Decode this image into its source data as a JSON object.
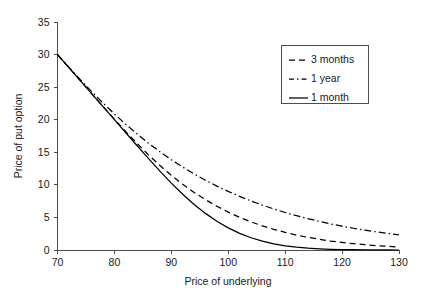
{
  "chart_data": {
    "type": "line",
    "title": "",
    "xlabel": "Price of underlying",
    "ylabel": "Price of put option",
    "xlim": [
      70,
      130
    ],
    "ylim": [
      0,
      35
    ],
    "xticks": [
      70,
      80,
      90,
      100,
      110,
      120,
      130
    ],
    "yticks": [
      0,
      5,
      10,
      15,
      20,
      25,
      30,
      35
    ],
    "grid": false,
    "legend_position": "top-right",
    "x": [
      70,
      72,
      74,
      76,
      78,
      80,
      82,
      84,
      86,
      88,
      90,
      92,
      94,
      96,
      98,
      100,
      102,
      104,
      106,
      108,
      110,
      112,
      114,
      116,
      118,
      120,
      122,
      124,
      126,
      128,
      130
    ],
    "series": [
      {
        "name": "3 months",
        "style": "dashed",
        "color": "#000000",
        "values": [
          30.0,
          28.0,
          26.0,
          24.0,
          22.02,
          20.07,
          18.17,
          16.34,
          14.6,
          12.97,
          11.47,
          10.09,
          8.84,
          7.72,
          6.72,
          5.82,
          5.02,
          4.32,
          3.71,
          3.17,
          2.7,
          2.29,
          1.94,
          1.64,
          1.38,
          1.16,
          0.97,
          0.81,
          0.67,
          0.56,
          0.46
        ]
      },
      {
        "name": "1 year",
        "style": "dash-dot",
        "color": "#000000",
        "values": [
          30.0,
          28.06,
          26.16,
          24.32,
          22.56,
          20.88,
          19.29,
          17.79,
          16.39,
          15.08,
          13.86,
          12.73,
          11.68,
          10.71,
          9.81,
          8.99,
          8.23,
          7.53,
          6.89,
          6.3,
          5.76,
          5.26,
          4.81,
          4.39,
          4.01,
          3.66,
          3.34,
          3.05,
          2.79,
          2.55,
          2.33
        ]
      },
      {
        "name": "1 month",
        "style": "solid",
        "color": "#000000",
        "values": [
          30.0,
          28.0,
          26.0,
          24.0,
          22.0,
          20.0,
          18.0,
          16.0,
          14.02,
          12.1,
          10.27,
          8.56,
          7.0,
          5.62,
          4.42,
          3.4,
          2.56,
          1.88,
          1.35,
          0.95,
          0.65,
          0.43,
          0.28,
          0.18,
          0.11,
          0.07,
          0.04,
          0.02,
          0.01,
          0.01,
          0.0
        ]
      }
    ],
    "legend_entries": [
      {
        "label": "3 months",
        "style": "dashed"
      },
      {
        "label": "1 year",
        "style": "dash-dot"
      },
      {
        "label": "1 month",
        "style": "solid"
      }
    ]
  }
}
